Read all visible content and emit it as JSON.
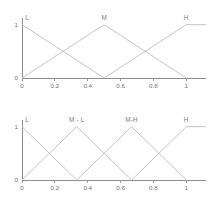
{
  "figure": {
    "background_color": "#ffffff",
    "line_color": "#bdbdbd",
    "axis_color": "#8e8e8e",
    "text_color": "#6f6f6f"
  },
  "chart_data": [
    {
      "type": "line",
      "title": "",
      "subtitle": "",
      "xlabel": "",
      "ylabel": "",
      "xlim": [
        0,
        1.12
      ],
      "ylim": [
        0,
        1.05
      ],
      "grid": false,
      "legend": "inline-annotations",
      "xticks": [
        "0",
        "0.2",
        "0.4",
        "0.6",
        "0.8",
        "1"
      ],
      "xtick_values": [
        0,
        0.2,
        0.4,
        0.6,
        0.8,
        1
      ],
      "yticks": [
        "0",
        "1"
      ],
      "ytick_values": [
        0,
        1
      ],
      "annotations": [
        {
          "text": "L",
          "x": 0.02,
          "y": 1.05
        },
        {
          "text": "M",
          "x": 0.5,
          "y": 1.05
        },
        {
          "text": "H",
          "x": 1.0,
          "y": 1.05
        }
      ],
      "series": [
        {
          "name": "L",
          "x": [
            0,
            0.5
          ],
          "values": [
            1,
            0
          ]
        },
        {
          "name": "M",
          "x": [
            0,
            0.5,
            1
          ],
          "values": [
            0,
            1,
            0
          ]
        },
        {
          "name": "H",
          "x": [
            0.5,
            1,
            1.12
          ],
          "values": [
            0,
            1,
            1
          ]
        }
      ]
    },
    {
      "type": "line",
      "title": "",
      "subtitle": "",
      "xlabel": "",
      "ylabel": "",
      "xlim": [
        0,
        1.12
      ],
      "ylim": [
        0,
        1.05
      ],
      "grid": false,
      "legend": "inline-annotations",
      "xticks": [
        "0",
        "0.2",
        "0.4",
        "0.6",
        "0.8",
        "1"
      ],
      "xtick_values": [
        0,
        0.2,
        0.4,
        0.6,
        0.8,
        1
      ],
      "yticks": [
        "0",
        "1"
      ],
      "ytick_values": [
        0,
        1
      ],
      "annotations": [
        {
          "text": "L",
          "x": 0.02,
          "y": 1.05
        },
        {
          "text": "M - L",
          "x": 0.333,
          "y": 1.05
        },
        {
          "text": "M-H",
          "x": 0.667,
          "y": 1.05
        },
        {
          "text": "H",
          "x": 1.0,
          "y": 1.05
        }
      ],
      "series": [
        {
          "name": "L",
          "x": [
            0,
            0.333
          ],
          "values": [
            1,
            0
          ]
        },
        {
          "name": "M - L",
          "x": [
            0,
            0.333,
            0.667
          ],
          "values": [
            0,
            1,
            0
          ]
        },
        {
          "name": "M-H",
          "x": [
            0.333,
            0.667,
            1
          ],
          "values": [
            0,
            1,
            0
          ]
        },
        {
          "name": "H",
          "x": [
            0.667,
            1,
            1.12
          ],
          "values": [
            0,
            1,
            1
          ]
        }
      ]
    }
  ]
}
